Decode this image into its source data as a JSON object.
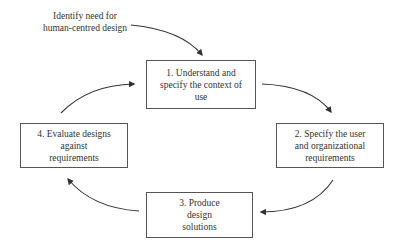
{
  "diagram": {
    "entry_point": {
      "lines": [
        "Identify need for",
        "human-centred design"
      ],
      "target_step": 1
    },
    "steps": [
      {
        "number": 1,
        "lines": [
          "1. Understand and",
          "specify the context of",
          "use"
        ]
      },
      {
        "number": 2,
        "lines": [
          "2. Specify the user",
          "and organizational",
          "requirements"
        ]
      },
      {
        "number": 3,
        "lines": [
          "3. Produce",
          "design",
          "solutions"
        ]
      },
      {
        "number": 4,
        "lines": [
          "4. Evaluate designs",
          "against",
          "requirements"
        ]
      }
    ],
    "flows": [
      {
        "from": "entry",
        "to": 1
      },
      {
        "from": 1,
        "to": 2
      },
      {
        "from": 2,
        "to": 3
      },
      {
        "from": 3,
        "to": 4
      },
      {
        "from": 4,
        "to": 1
      }
    ],
    "colors": {
      "line": "#333333",
      "box_border": "#555555",
      "text": "#333333",
      "background": "#ffffff"
    }
  }
}
